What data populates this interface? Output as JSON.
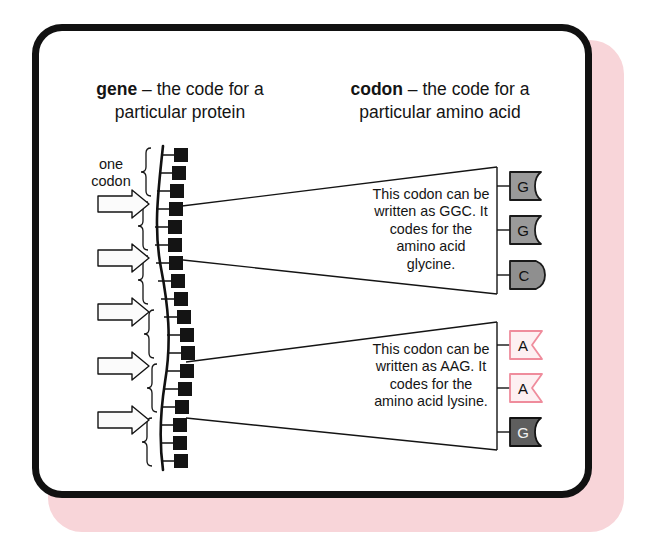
{
  "figure": {
    "headings": [
      {
        "term": "gene",
        "dash": " – the code for a",
        "line2": "particular protein"
      },
      {
        "term": "codon",
        "dash": " – the code for a",
        "line2": "particular amino acid"
      }
    ],
    "left_label": {
      "line1": "one",
      "line2": "codon"
    },
    "callouts": [
      {
        "id": "callout-glycine",
        "text": "This codon can be written as GGC. It codes for the amino acid glycine.",
        "bases": [
          {
            "letter": "G",
            "shape": "notch",
            "fill": "#9a9a9a",
            "stroke": "#1a1a1a"
          },
          {
            "letter": "G",
            "shape": "notch",
            "fill": "#9a9a9a",
            "stroke": "#1a1a1a"
          },
          {
            "letter": "C",
            "shape": "bulge",
            "fill": "#8f8f8f",
            "stroke": "#1a1a1a"
          }
        ]
      },
      {
        "id": "callout-lysine",
        "text": "This codon can be written as AAG. It codes for the amino acid lysine.",
        "bases": [
          {
            "letter": "A",
            "shape": "vee",
            "fill": "#fdf0f2",
            "stroke": "#ef8c9c"
          },
          {
            "letter": "A",
            "shape": "vee",
            "fill": "#fdf0f2",
            "stroke": "#ef8c9c"
          },
          {
            "letter": "G",
            "shape": "notch",
            "fill": "#5e5e5e",
            "stroke": "#121212"
          }
        ]
      }
    ],
    "gene_strand": {
      "base_count": 18,
      "bracket_count": 6,
      "arrow_count": 5
    },
    "colors": {
      "frame": "#111111",
      "shadow": "#f8d5d9",
      "background": "#ffffff",
      "base_gray": "#9a9a9a",
      "base_pink": "#ef8c9c",
      "ink": "#141414"
    }
  }
}
